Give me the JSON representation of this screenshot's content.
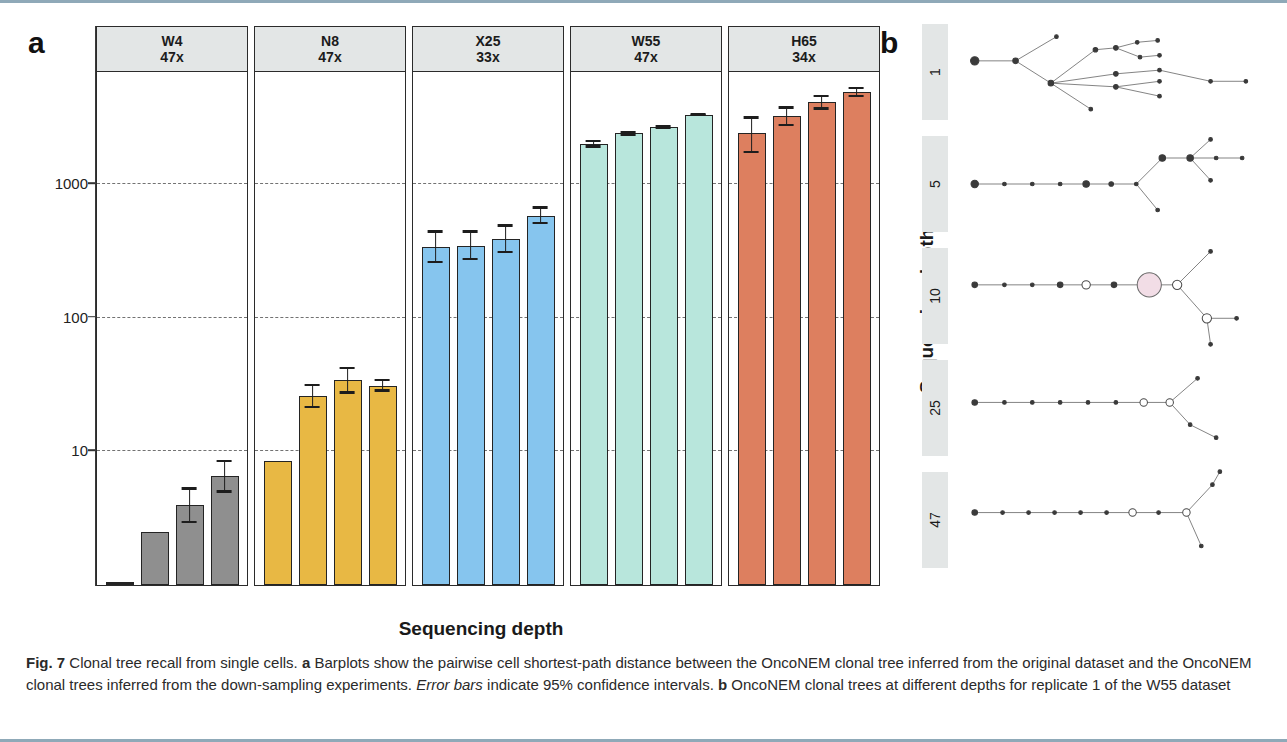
{
  "figure": {
    "number": "Fig. 7",
    "panel_a_letter": "a",
    "panel_b_letter": "b",
    "caption_parts": {
      "bold_label": "Fig. 7",
      "title": " Clonal tree recall from single cells. ",
      "a_letter": "a",
      "a_text": " Barplots show the pairwise cell shortest-path distance between the OncoNEM clonal tree inferred from the original dataset and the OncoNEM clonal trees inferred from the down-sampling experiments. ",
      "error_italic": "Error bars",
      "error_text": " indicate 95% confidence intervals. ",
      "b_letter": "b",
      "b_text": " OncoNEM clonal trees at different depths for replicate 1 of the W55 dataset"
    }
  },
  "chart_data": {
    "type": "bar",
    "title": "Clonal tree recall from single cells",
    "xlabel": "Sequencing depth",
    "ylabel": "oncoNEM - Shortest path distance",
    "yscale": "log10",
    "ylim": [
      1,
      7000
    ],
    "yticks": [
      10,
      100,
      1000
    ],
    "ytick_labels": [
      "10",
      "100",
      "1000"
    ],
    "grid": "horizontal-dashed",
    "categories": [
      "25",
      "10",
      "5",
      "1"
    ],
    "panels": [
      {
        "dataset": "W4",
        "depth": "47x",
        "color": "#8f8f8f",
        "values": [
          0,
          2.5,
          4.0,
          6.5
        ],
        "ci_low": [
          0,
          2.5,
          2.9,
          4.9
        ],
        "ci_high": [
          0,
          2.5,
          5.4,
          8.6
        ]
      },
      {
        "dataset": "N8",
        "depth": "47x",
        "color": "#e8b844",
        "values": [
          8.5,
          26,
          34,
          31
        ],
        "ci_low": [
          8.5,
          21,
          27,
          28
        ],
        "ci_high": [
          8.5,
          32,
          43,
          35
        ]
      },
      {
        "dataset": "X25",
        "depth": "33x",
        "color": "#86c5ee",
        "values": [
          340,
          345,
          390,
          580
        ],
        "ci_low": [
          255,
          270,
          305,
          500
        ],
        "ci_high": [
          450,
          450,
          500,
          680
        ]
      },
      {
        "dataset": "W55",
        "depth": "47x",
        "color": "#b8e6dc",
        "values": [
          2000,
          2400,
          2650,
          3300
        ],
        "ci_low": [
          1870,
          2300,
          2560,
          3200
        ],
        "ci_high": [
          2140,
          2510,
          2760,
          3410
        ]
      },
      {
        "dataset": "H65",
        "depth": "34x",
        "color": "#dd7f5f",
        "values": [
          2400,
          3200,
          4100,
          4900
        ],
        "ci_low": [
          1700,
          2700,
          3600,
          4450
        ],
        "ci_high": [
          3200,
          3800,
          4650,
          5350
        ]
      }
    ]
  },
  "panel_b": {
    "axis_title": "Sequencing depth",
    "rows": [
      {
        "depth_label": "1"
      },
      {
        "depth_label": "5"
      },
      {
        "depth_label": "10"
      },
      {
        "depth_label": "25"
      },
      {
        "depth_label": "47"
      }
    ]
  }
}
